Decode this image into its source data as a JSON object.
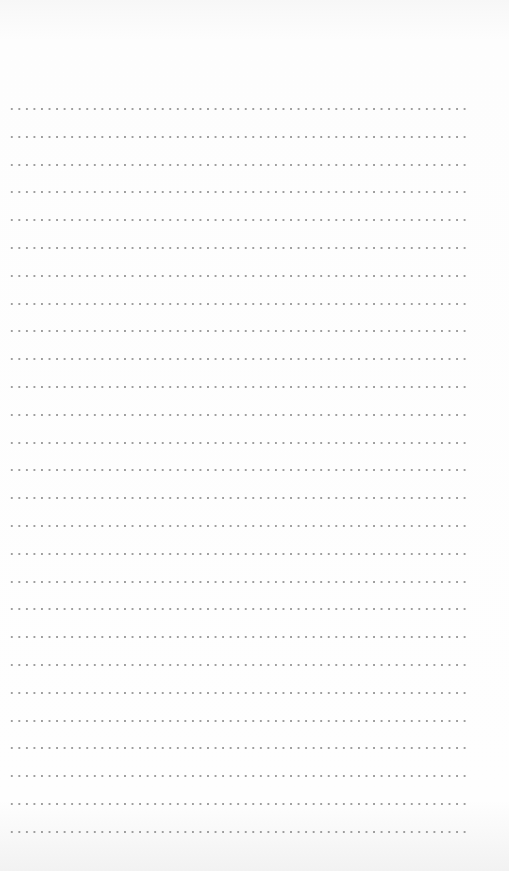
{
  "page": {
    "type": "dotted-lined-paper",
    "line_count": 27,
    "first_line_y": 108,
    "line_spacing": 27.8,
    "dot_color": "#9e9e9e",
    "background_color": "#fbfbfb"
  }
}
